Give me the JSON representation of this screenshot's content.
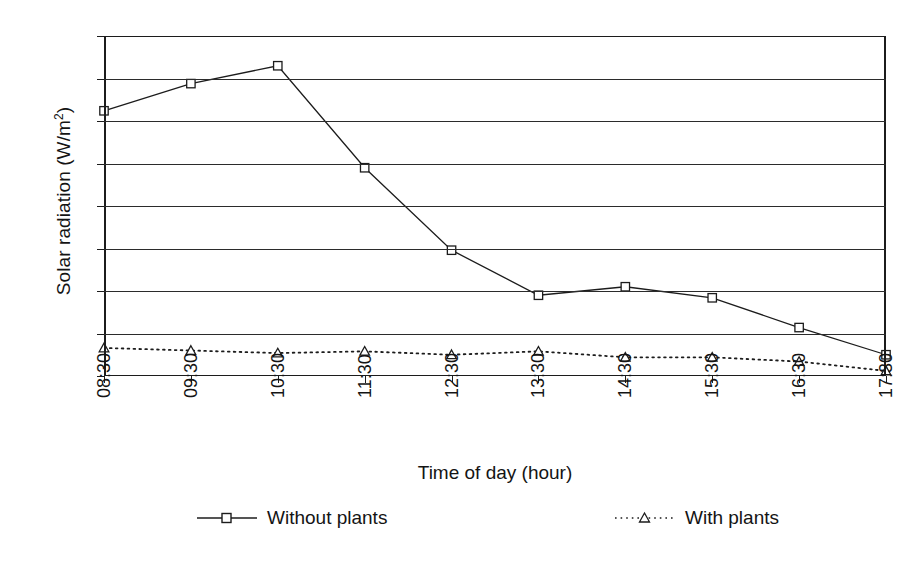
{
  "chart_data": {
    "type": "line",
    "title": "",
    "xlabel": "Time of day (hour)",
    "ylabel": "Solar radiation (W/m2)",
    "ylabel_display": "Solar radiation (W/m",
    "ylabel_superscript": "2",
    "ylabel_suffix": ")",
    "categories": [
      "08:30",
      "09:30",
      "10:30",
      "11:30",
      "12:30",
      "13:30",
      "14:30",
      "15:30",
      "16:30",
      "17:30"
    ],
    "series": [
      {
        "name": "Without plants",
        "marker": "square",
        "linestyle": "solid",
        "color": "#1c1c1c",
        "values": [
          312,
          344,
          365,
          245,
          148,
          95,
          105,
          92,
          57,
          25
        ]
      },
      {
        "name": "With plants",
        "marker": "triangle",
        "linestyle": "dotted",
        "color": "#1c1c1c",
        "values": [
          33,
          30,
          27,
          29,
          25,
          29,
          22,
          22,
          17,
          6
        ]
      }
    ],
    "ylim": [
      0,
      400
    ],
    "yticks": [
      0,
      50,
      100,
      150,
      200,
      250,
      300,
      350,
      400
    ],
    "ytick_labels": [
      "0",
      "50",
      "100",
      "150",
      "200",
      "250",
      "300",
      "350",
      "400"
    ],
    "grid": true,
    "grid_axis": "y",
    "legend_position": "bottom",
    "legend_entries": [
      "Without plants",
      "With plants"
    ]
  },
  "colors": {
    "axis": "#1c1c1c",
    "grid": "#2b2b2b",
    "text": "#141414",
    "background": "#ffffff"
  }
}
